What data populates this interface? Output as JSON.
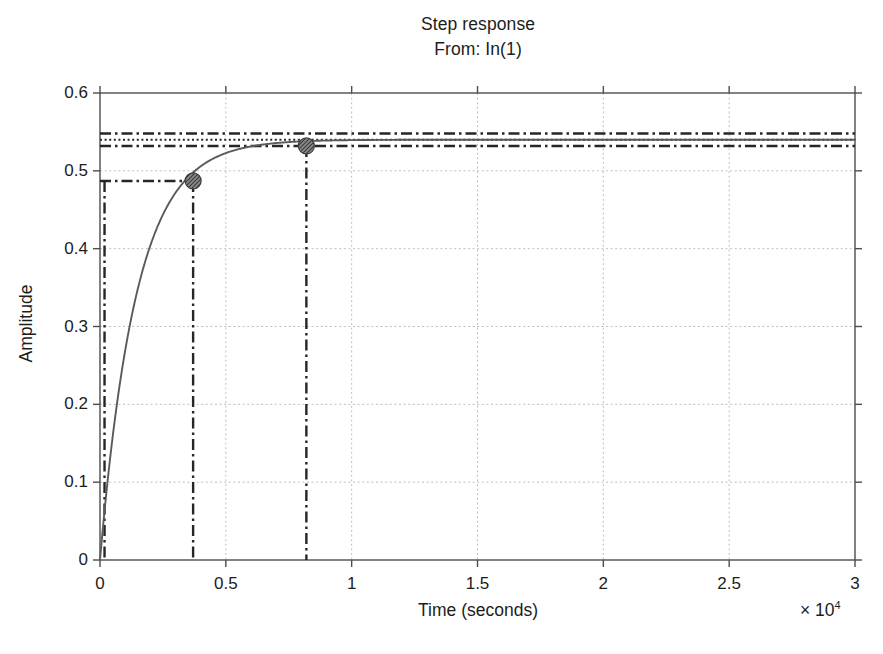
{
  "chart_data": {
    "type": "line",
    "title": "Step response",
    "subtitle": "From: In(1)",
    "xlabel": "Time (seconds)",
    "ylabel": "Amplitude",
    "x_multiplier": "× 10",
    "x_multiplier_exp": "4",
    "xlim": [
      0,
      3
    ],
    "ylim": [
      0,
      0.6
    ],
    "xticks": [
      0,
      0.5,
      1,
      1.5,
      2,
      2.5,
      3
    ],
    "xtick_labels": [
      "0",
      "0.5",
      "1",
      "1.5",
      "2",
      "2.5",
      "3"
    ],
    "yticks": [
      0,
      0.1,
      0.2,
      0.3,
      0.4,
      0.5,
      0.6
    ],
    "ytick_labels": [
      "0",
      "0.1",
      "0.2",
      "0.3",
      "0.4",
      "0.5",
      "0.6"
    ],
    "grid": true,
    "grid_style": "dotted",
    "legend": null,
    "series": [
      {
        "name": "step-response",
        "style": "solid",
        "color": "#5a5a5a",
        "steady_state": 0.54,
        "time_constant_seconds": 1450,
        "x": [
          0,
          100,
          200,
          300,
          400,
          500,
          600,
          700,
          800,
          900,
          1000,
          1200,
          1400,
          1600,
          1800,
          2000,
          2400,
          2800,
          3200,
          3700,
          4200,
          5000,
          6000,
          7000,
          8200,
          10000,
          12000,
          15000,
          20000,
          25000,
          30000
        ],
        "values": [
          0.0,
          0.036,
          0.069,
          0.1,
          0.128,
          0.154,
          0.178,
          0.2,
          0.221,
          0.24,
          0.258,
          0.289,
          0.316,
          0.339,
          0.359,
          0.377,
          0.405,
          0.427,
          0.444,
          0.46,
          0.472,
          0.487,
          0.5,
          0.51,
          0.52,
          0.53,
          0.535,
          0.538,
          0.5397,
          0.54,
          0.54
        ]
      }
    ],
    "markers": [
      {
        "name": "rise-time-marker",
        "x": 3700,
        "y": 0.487,
        "label": ""
      },
      {
        "name": "settling-time-marker",
        "x": 8200,
        "y": 0.532,
        "label": ""
      }
    ],
    "reference_lines": [
      {
        "name": "upper-tolerance-line",
        "orientation": "horizontal",
        "value": 0.548,
        "style": "dashdot"
      },
      {
        "name": "steady-state-line",
        "orientation": "horizontal",
        "value": 0.54,
        "style": "dotted"
      },
      {
        "name": "lower-tolerance-line",
        "orientation": "horizontal",
        "value": 0.532,
        "style": "dashdot"
      },
      {
        "name": "rise-level-line",
        "orientation": "horizontal",
        "value": 0.487,
        "style": "dashdot",
        "x_end": 3700
      },
      {
        "name": "start-time-line",
        "orientation": "vertical",
        "value": 180,
        "style": "dashdot",
        "y_end": 0.487
      },
      {
        "name": "rise-time-line",
        "orientation": "vertical",
        "value": 3700,
        "style": "dashdot",
        "y_end": 0.487
      },
      {
        "name": "settling-time-line",
        "orientation": "vertical",
        "value": 8200,
        "style": "dashdot",
        "y_end": 0.532
      }
    ]
  }
}
